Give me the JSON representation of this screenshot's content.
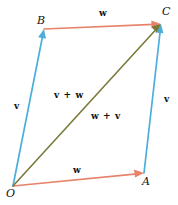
{
  "figure": {
    "width": 178,
    "height": 205,
    "background": "#ffffff",
    "caption": "Parallelogram law of vector addition"
  },
  "colors": {
    "vector_v": "#4BAEDC",
    "vector_w": "#E8836B",
    "resultant": "#7A7A3A",
    "label_text": "#111111",
    "background": "#ffffff"
  },
  "vertices": [
    {
      "id": "O",
      "label": "O",
      "x": 13,
      "y": 186,
      "label_x": 6,
      "label_y": 188
    },
    {
      "id": "A",
      "label": "A",
      "x": 144,
      "y": 173,
      "label_x": 142,
      "label_y": 176
    },
    {
      "id": "B",
      "label": "B",
      "x": 44,
      "y": 29,
      "label_x": 37,
      "label_y": 15
    },
    {
      "id": "C",
      "label": "C",
      "x": 161,
      "y": 24,
      "label_x": 162,
      "label_y": 6
    }
  ],
  "vectors": [
    {
      "id": "OB",
      "name": "v",
      "from": "O",
      "to": "B",
      "color": "#4BAEDC",
      "x1": 13,
      "y1": 186,
      "x2": 44,
      "y2": 29,
      "label_x": 14,
      "label_y": 102
    },
    {
      "id": "AC",
      "name": "v",
      "from": "A",
      "to": "C",
      "color": "#4BAEDC",
      "x1": 144,
      "y1": 173,
      "x2": 161,
      "y2": 24,
      "label_x": 164,
      "label_y": 95
    },
    {
      "id": "OA",
      "name": "w",
      "from": "O",
      "to": "A",
      "color": "#E8836B",
      "x1": 13,
      "y1": 186,
      "x2": 144,
      "y2": 173,
      "label_x": 73,
      "label_y": 166
    },
    {
      "id": "BC",
      "name": "w",
      "from": "B",
      "to": "C",
      "color": "#E8836B",
      "x1": 44,
      "y1": 29,
      "x2": 161,
      "y2": 24,
      "label_x": 99,
      "label_y": 9
    }
  ],
  "diagonal": {
    "id": "OC",
    "from": "O",
    "to": "C",
    "color": "#7A7A3A",
    "x1": 13,
    "y1": 186,
    "x2": 161,
    "y2": 24,
    "labels": [
      {
        "id": "v-plus-w",
        "text": "v + w",
        "x": 54,
        "y": 91
      },
      {
        "id": "w-plus-v",
        "text": "w + v",
        "x": 91,
        "y": 112
      }
    ]
  }
}
